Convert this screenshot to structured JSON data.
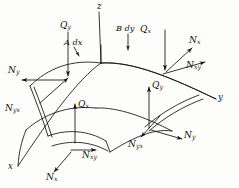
{
  "figure": {
    "kind": "shell-element-force-resultant-diagram",
    "stroke_color": "#14120f",
    "background_color": "#fdfdfb"
  },
  "axes": [
    {
      "name": "z-axis",
      "label": "z"
    },
    {
      "name": "y-axis",
      "label": "y"
    },
    {
      "name": "x-axis",
      "label": "x"
    }
  ],
  "dimensions": [
    {
      "name": "a-dx",
      "symbol": "A",
      "differential": "dx",
      "text": "A dx"
    },
    {
      "name": "b-dy",
      "symbol": "B",
      "differential": "dy",
      "text": "B dy"
    }
  ],
  "resultants": {
    "top_left_face": [
      {
        "name": "q-y-top-left",
        "base": "Q",
        "sub": "y",
        "direction": "down"
      },
      {
        "name": "n-y-left",
        "base": "N",
        "sub": "y",
        "direction": "left"
      },
      {
        "name": "n-yx-left",
        "base": "N",
        "sub": "yx",
        "direction": "along-edge"
      }
    ],
    "top_right_face": [
      {
        "name": "q-x-top-right",
        "base": "Q",
        "sub": "x",
        "direction": "down"
      },
      {
        "name": "n-x-top-right",
        "base": "N",
        "sub": "x",
        "direction": "up-right"
      },
      {
        "name": "n-xy-top-right",
        "base": "N",
        "sub": "xy",
        "direction": "right-along-edge"
      }
    ],
    "near_face": [
      {
        "name": "q-x-near",
        "base": "Q",
        "sub": "x",
        "direction": "up"
      },
      {
        "name": "n-xy-near",
        "base": "N",
        "sub": "xy",
        "direction": "right"
      },
      {
        "name": "n-x-near",
        "base": "N",
        "sub": "x",
        "direction": "down-left"
      }
    ],
    "right_face": [
      {
        "name": "q-y-right",
        "base": "Q",
        "sub": "y",
        "direction": "up"
      },
      {
        "name": "n-y-right",
        "base": "N",
        "sub": "y",
        "direction": "right"
      },
      {
        "name": "n-yx-right",
        "base": "N",
        "sub": "yx",
        "direction": "down-left"
      }
    ]
  }
}
